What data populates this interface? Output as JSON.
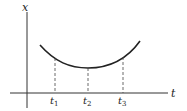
{
  "diagram": {
    "type": "function-curve",
    "axes": {
      "vertical_label": "x",
      "horizontal_label": "t"
    },
    "curve": {
      "shape": "u-shaped",
      "description": "convex curve with a minimum at t2"
    },
    "markers": [
      {
        "label": "t",
        "sub": "1"
      },
      {
        "label": "t",
        "sub": "2"
      },
      {
        "label": "t",
        "sub": "3"
      }
    ]
  }
}
